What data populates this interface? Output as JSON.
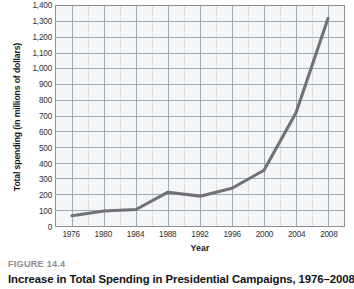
{
  "figure": {
    "number_label": "FIGURE 14.4",
    "title": "Increase in Total Spending in Presidential Campaigns, 1976–2008"
  },
  "axes": {
    "y_title": "Total spending (in millions of dollars)",
    "x_title": "Year"
  },
  "colors": {
    "line": "#6f7174",
    "plot_background": "#f4f5f6",
    "major_gridline": "#9aa0a4",
    "minor_gridline": "#d9dcde",
    "frame": "#8d9195",
    "figure_number_text": "#8a8d90",
    "title_text": "#101315"
  },
  "chart_data": {
    "type": "line",
    "title": "Increase in Total Spending in Presidential Campaigns, 1976–2008",
    "xlabel": "Year",
    "ylabel": "Total spending (in millions of dollars)",
    "x": [
      1976,
      1980,
      1984,
      1988,
      1992,
      1996,
      2000,
      2004,
      2008
    ],
    "values": [
      65,
      95,
      105,
      215,
      190,
      240,
      355,
      720,
      1320
    ],
    "xlim": [
      1974,
      2010
    ],
    "ylim": [
      0,
      1400
    ],
    "xticks": [
      1976,
      1980,
      1984,
      1988,
      1992,
      1996,
      2000,
      2004,
      2008
    ],
    "xticklabels": [
      "1976",
      "1980",
      "1984",
      "1988",
      "1992",
      "1996",
      "2000",
      "2004",
      "2008"
    ],
    "yticks": [
      0,
      100,
      200,
      300,
      400,
      500,
      600,
      700,
      800,
      900,
      1000,
      1100,
      1200,
      1300,
      1400
    ],
    "yticklabels": [
      "0",
      "100",
      "200",
      "300",
      "400",
      "500",
      "600",
      "700",
      "800",
      "900",
      "1,000",
      "1,100",
      "1,200",
      "1,300",
      "1,400"
    ],
    "x_minor_ticks": [
      1978,
      1982,
      1986,
      1990,
      1994,
      1998,
      2002,
      2006
    ],
    "grid": true,
    "legend": null,
    "series": [
      {
        "name": "Total spending",
        "values": [
          65,
          95,
          105,
          215,
          190,
          240,
          355,
          720,
          1320
        ]
      }
    ]
  }
}
